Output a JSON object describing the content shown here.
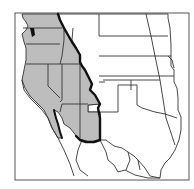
{
  "map": {
    "type": "range-map",
    "region": "Western United States and northern Mexico",
    "colors": {
      "range_fill": "#bdbdbd",
      "background": "#ffffff",
      "border": "#333333",
      "range_outline": "#111111"
    },
    "shaded_region_label": "distribution range",
    "states_in_range": [
      "Washington",
      "Oregon",
      "California",
      "Idaho",
      "Nevada",
      "Utah",
      "Arizona",
      "Montana",
      "Wyoming",
      "Colorado",
      "New Mexico"
    ],
    "states_outside_range": [
      "North Dakota",
      "South Dakota",
      "Nebraska",
      "Kansas",
      "Oklahoma",
      "Texas",
      "Minnesota",
      "Iowa",
      "Missouri"
    ]
  }
}
